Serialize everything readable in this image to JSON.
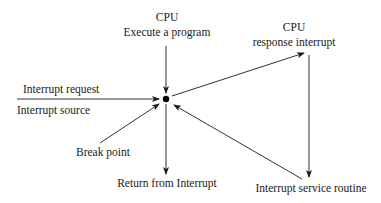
{
  "diagram": {
    "type": "interrupt-flow",
    "center_node": {
      "shape": "dot",
      "color": "#000000"
    },
    "nodes": {
      "cpu_execute": {
        "title": "CPU",
        "subtitle": "Execute a program"
      },
      "cpu_response": {
        "title": "CPU",
        "subtitle": "response interrupt"
      },
      "interrupt_request": {
        "label": "Interrupt request"
      },
      "interrupt_source": {
        "label": "Interrupt source"
      },
      "break_point": {
        "label": "Break point"
      },
      "return_from_interrupt": {
        "label": "Return from Interrupt"
      },
      "interrupt_service_routine": {
        "label": "Interrupt service  routine"
      }
    },
    "edges": [
      {
        "from": "cpu_execute",
        "to": "center"
      },
      {
        "from": "interrupt_source",
        "to": "center"
      },
      {
        "from": "break_point",
        "to": "center"
      },
      {
        "from": "center",
        "to": "cpu_response"
      },
      {
        "from": "cpu_response",
        "to": "interrupt_service_routine"
      },
      {
        "from": "interrupt_service_routine",
        "to": "center"
      },
      {
        "from": "center",
        "to": "return_from_interrupt"
      }
    ],
    "colors": {
      "line": "#1a1a1a",
      "background": "#ffffff"
    }
  }
}
